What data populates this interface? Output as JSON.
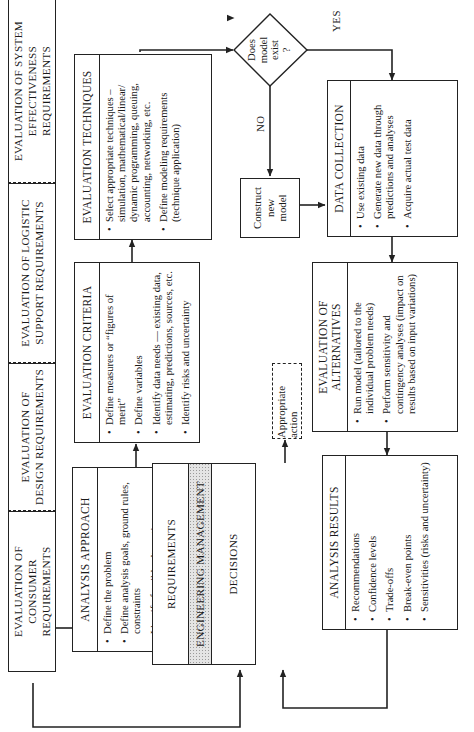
{
  "top_requirements": [
    {
      "id": "consumer",
      "label": "EVALUATION OF CONSUMER REQUIREMENTS",
      "line1": "EVALUATION OF",
      "line2": "CONSUMER REQUIREMENTS"
    },
    {
      "id": "design",
      "label": "EVALUATION OF DESIGN REQUIREMENTS",
      "line1": "EVALUATION OF",
      "line2": "DESIGN REQUIREMENTS"
    },
    {
      "id": "logistic",
      "label": "EVALUATION OF LOGISTIC SUPPORT REQUIREMENTS",
      "line1": "EVALUATION OF LOGISTIC",
      "line2": "SUPPORT REQUIREMENTS"
    },
    {
      "id": "system",
      "label": "EVALUATION OF SYSTEM EFFECTIVENESS REQUIREMENTS",
      "line1": "EVALUATION OF SYSTEM",
      "line2": "EFFECTIVENESS REQUIREMENTS"
    }
  ],
  "analysis_approach": {
    "title": "ANALYSIS APPROACH",
    "items": [
      "Define the problem",
      "Define analysis goals, ground rules, constraints",
      "Identify feasible alternatives",
      "Define approach to problem resolution"
    ]
  },
  "evaluation_criteria": {
    "title": "EVALUATION CRITERIA",
    "items": [
      "Define measures or “figures of merit”",
      "Define variables",
      "Identify data needs — existing data, estimating, predictions, sources, etc.",
      "Identify risks and uncertainty"
    ]
  },
  "evaluation_techniques": {
    "title": "EVALUATION TECHNIQUES",
    "items": [
      "Select appropriate techniques – simulation, mathematical/linear/ dynamic programming, queuing, accounting, networking, etc.",
      "Define modeling requirements (technique application)"
    ]
  },
  "decision_diamond": {
    "line1": "Does",
    "line2": "model",
    "line3": "exist",
    "line4": "?",
    "yes_label": "YES",
    "no_label": "NO"
  },
  "construct_model": {
    "line1": "Construct",
    "line2": "new",
    "line3": "model"
  },
  "management": {
    "requirements": "REQUIREMENTS",
    "engineering": "ENGINEERING MANAGEMENT",
    "decisions": "DECISIONS"
  },
  "appropriate_action": {
    "label": "Appropriate action"
  },
  "analysis_results": {
    "title": "ANALYSIS RESULTS",
    "items": [
      "Recommendations",
      "Confidence levels",
      "Trade-offs",
      "Break-even points",
      "Sensitivities (risks and uncertainty)"
    ]
  },
  "evaluation_alternatives": {
    "title_line1": "EVALUATION OF",
    "title_line2": "ALTERNATIVES",
    "items": [
      "Run model (tailored to the individual problem needs)",
      "Perform sensitivity and contingency analyses (impact on results based on input variations)"
    ]
  },
  "data_collection": {
    "title": "DATA COLLECTION",
    "items": [
      "Use existing data",
      "Generate new data through predictions and analyses",
      "Acquire actual test data"
    ]
  },
  "colors": {
    "ink": "#222222",
    "paper": "#ffffff",
    "shade": "#e4e4e4"
  }
}
